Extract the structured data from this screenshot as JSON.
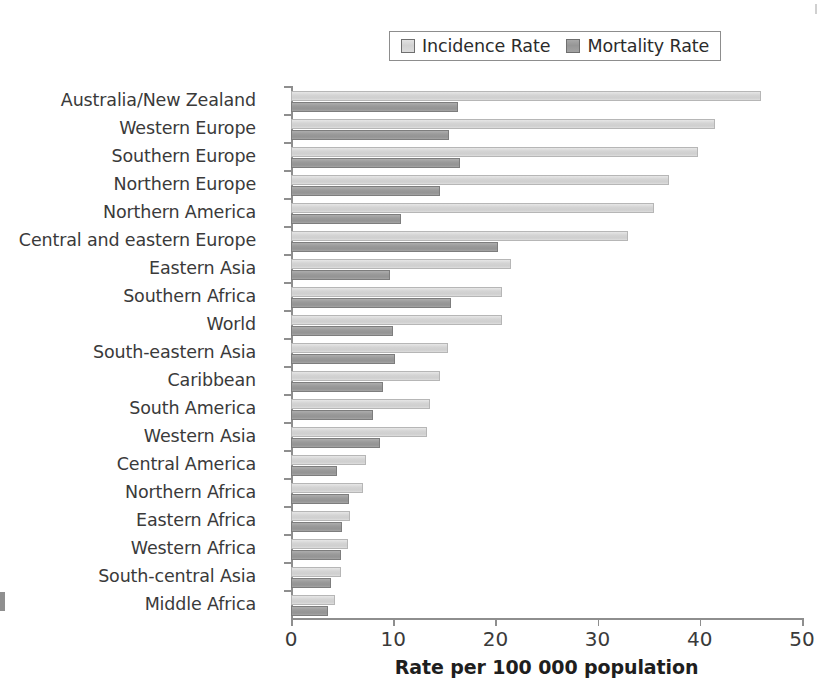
{
  "chart_data": {
    "type": "bar",
    "orientation": "horizontal",
    "title": "",
    "xlabel": "Rate per 100 000 population",
    "ylabel": "",
    "xlim": [
      0,
      50
    ],
    "xticks": [
      0,
      10,
      20,
      30,
      40,
      50
    ],
    "grid": false,
    "legend_position": "top-center",
    "categories": [
      "Australia/New Zealand",
      "Western Europe",
      "Southern Europe",
      "Northern Europe",
      "Northern America",
      "Central and eastern Europe",
      "Eastern Asia",
      "Southern Africa",
      "World",
      "South-eastern Asia",
      "Caribbean",
      "South America",
      "Western Asia",
      "Central America",
      "Northern Africa",
      "Eastern Africa",
      "Western Africa",
      "South-central Asia",
      "Middle Africa"
    ],
    "series": [
      {
        "name": "Incidence Rate",
        "color": "#d4d4d4",
        "values": [
          46.0,
          41.5,
          39.8,
          37.0,
          35.5,
          33.0,
          21.5,
          20.6,
          20.6,
          15.4,
          14.6,
          13.6,
          13.3,
          7.3,
          7.0,
          5.8,
          5.6,
          4.9,
          4.3
        ]
      },
      {
        "name": "Mortality Rate",
        "color": "#9a9a9a",
        "values": [
          16.3,
          15.5,
          16.5,
          14.6,
          10.8,
          20.3,
          9.7,
          15.7,
          10.0,
          10.2,
          9.0,
          8.0,
          8.7,
          4.5,
          5.7,
          5.0,
          4.9,
          3.9,
          3.6
        ]
      }
    ]
  },
  "legend": {
    "entries": [
      {
        "label": "Incidence Rate",
        "swatch": "incidence"
      },
      {
        "label": "Mortality Rate",
        "swatch": "mortality"
      }
    ]
  },
  "axis": {
    "x_title": "Rate per 100 000 population",
    "x_tick_labels": [
      "0",
      "10",
      "20",
      "30",
      "40",
      "50"
    ]
  },
  "colors": {
    "incidence": "#d4d4d4",
    "mortality": "#9a9a9a",
    "axis": "#8e8e8e",
    "text": "#3a3a3a",
    "background": "#ffffff"
  }
}
